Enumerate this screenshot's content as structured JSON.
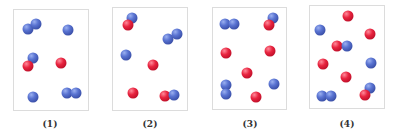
{
  "figure": {
    "colors": {
      "blue_atom": "#4a62c0",
      "red_atom": "#d8183a",
      "border": "#dcdcdc"
    },
    "panels": [
      {
        "label": "(1)",
        "box": {
          "x": 13,
          "y": 9,
          "w": 76,
          "h": 102
        },
        "label_pos": {
          "x": 50,
          "y": 119
        },
        "atoms": [
          {
            "c": "blue",
            "x": 28,
            "y": 29
          },
          {
            "c": "blue",
            "x": 36,
            "y": 24
          },
          {
            "c": "blue",
            "x": 68,
            "y": 30
          },
          {
            "c": "blue",
            "x": 33,
            "y": 58
          },
          {
            "c": "red",
            "x": 28,
            "y": 66
          },
          {
            "c": "red",
            "x": 61,
            "y": 63
          },
          {
            "c": "blue",
            "x": 33,
            "y": 97
          },
          {
            "c": "blue",
            "x": 67,
            "y": 93
          },
          {
            "c": "blue",
            "x": 76,
            "y": 93
          }
        ]
      },
      {
        "label": "(2)",
        "box": {
          "x": 112,
          "y": 7,
          "w": 76,
          "h": 104
        },
        "label_pos": {
          "x": 150,
          "y": 119
        },
        "atoms": [
          {
            "c": "blue",
            "x": 132,
            "y": 18
          },
          {
            "c": "red",
            "x": 128,
            "y": 25
          },
          {
            "c": "blue",
            "x": 168,
            "y": 39
          },
          {
            "c": "blue",
            "x": 177,
            "y": 34
          },
          {
            "c": "blue",
            "x": 126,
            "y": 55
          },
          {
            "c": "red",
            "x": 153,
            "y": 65
          },
          {
            "c": "red",
            "x": 133,
            "y": 93
          },
          {
            "c": "red",
            "x": 165,
            "y": 96
          },
          {
            "c": "blue",
            "x": 174,
            "y": 95
          }
        ]
      },
      {
        "label": "(3)",
        "box": {
          "x": 212,
          "y": 7,
          "w": 75,
          "h": 103
        },
        "label_pos": {
          "x": 250,
          "y": 119
        },
        "atoms": [
          {
            "c": "blue",
            "x": 225,
            "y": 24
          },
          {
            "c": "blue",
            "x": 234,
            "y": 24
          },
          {
            "c": "blue",
            "x": 273,
            "y": 18
          },
          {
            "c": "red",
            "x": 269,
            "y": 25
          },
          {
            "c": "red",
            "x": 226,
            "y": 53
          },
          {
            "c": "red",
            "x": 270,
            "y": 51
          },
          {
            "c": "red",
            "x": 247,
            "y": 73
          },
          {
            "c": "blue",
            "x": 226,
            "y": 85
          },
          {
            "c": "blue",
            "x": 226,
            "y": 94
          },
          {
            "c": "blue",
            "x": 274,
            "y": 84
          },
          {
            "c": "red",
            "x": 256,
            "y": 97
          }
        ]
      },
      {
        "label": "(4)",
        "box": {
          "x": 309,
          "y": 5,
          "w": 76,
          "h": 104
        },
        "label_pos": {
          "x": 347,
          "y": 119
        },
        "atoms": [
          {
            "c": "red",
            "x": 348,
            "y": 16
          },
          {
            "c": "blue",
            "x": 320,
            "y": 30
          },
          {
            "c": "red",
            "x": 370,
            "y": 34
          },
          {
            "c": "red",
            "x": 337,
            "y": 46
          },
          {
            "c": "blue",
            "x": 347,
            "y": 46
          },
          {
            "c": "red",
            "x": 323,
            "y": 64
          },
          {
            "c": "blue",
            "x": 371,
            "y": 63
          },
          {
            "c": "red",
            "x": 346,
            "y": 77
          },
          {
            "c": "blue",
            "x": 322,
            "y": 96
          },
          {
            "c": "blue",
            "x": 331,
            "y": 96
          },
          {
            "c": "blue",
            "x": 370,
            "y": 88
          },
          {
            "c": "red",
            "x": 365,
            "y": 95
          }
        ]
      }
    ]
  }
}
